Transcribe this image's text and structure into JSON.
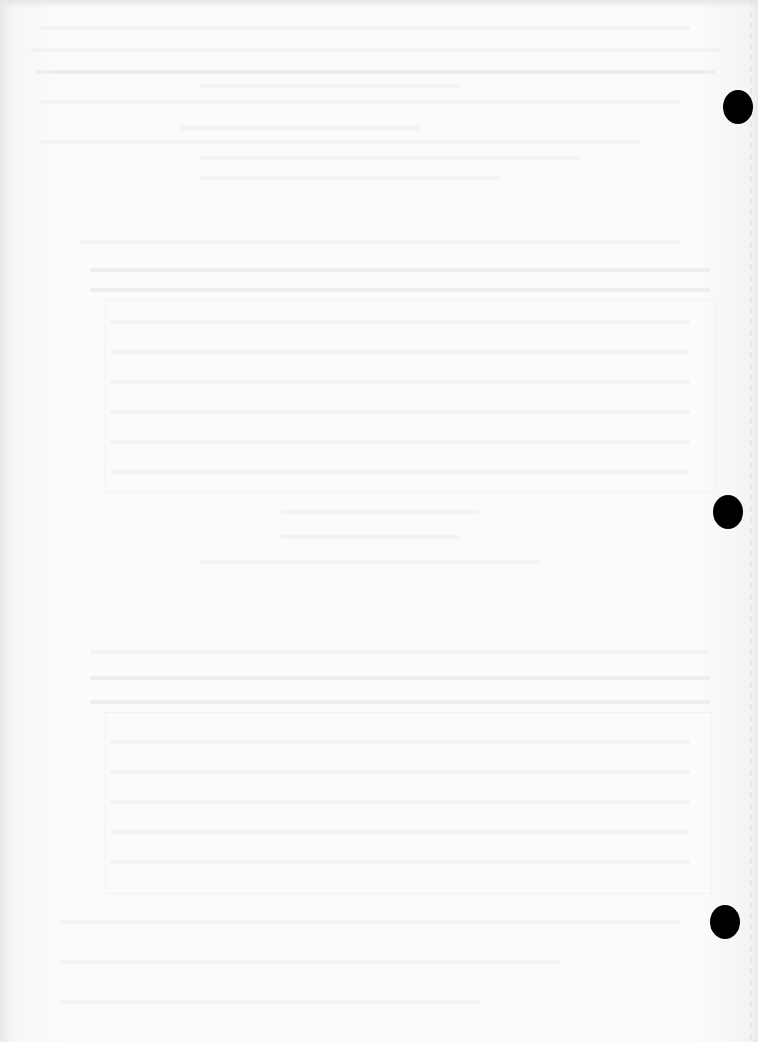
{
  "page": {
    "type": "scanned-blank-sheet",
    "content_legible": false,
    "note": "faint show-through from reverse side; no readable text",
    "background_color": "#f6f6f6",
    "punch_hole_color": "#000000",
    "punch_holes": [
      {
        "id": "top",
        "x": 738,
        "y": 107
      },
      {
        "id": "middle",
        "x": 728,
        "y": 512
      },
      {
        "id": "bottom",
        "x": 725,
        "y": 922
      }
    ]
  }
}
